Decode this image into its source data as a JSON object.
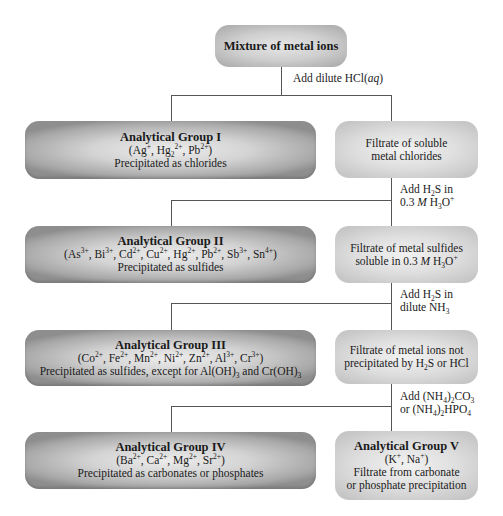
{
  "diagram": {
    "start": {
      "title": "Mixture of metal ions"
    },
    "steps": [
      {
        "reagent_line1": "Add dilute HCl(aq)",
        "reagent_line2": ""
      },
      {
        "reagent_line1": "Add H2S in",
        "reagent_line2": "0.3 M H3O+"
      },
      {
        "reagent_line1": "Add H2S in",
        "reagent_line2": "dilute NH3"
      },
      {
        "reagent_line1": "Add (NH4)2CO3",
        "reagent_line2": "or (NH4)2HPO4"
      }
    ],
    "groups": [
      {
        "title": "Analytical Group I",
        "ions": "(Ag+, Hg2 2+, Pb2+)",
        "note": "Precipitated as chlorides"
      },
      {
        "title": "Analytical Group II",
        "ions": "(As3+, Bi3+, Cd2+, Cu2+, Hg2+, Pb2+, Sb3+, Sn4+)",
        "note": "Precipitated as sulfides"
      },
      {
        "title": "Analytical Group III",
        "ions": "(Co2+, Fe2+, Mn2+, Ni2+, Zn2+, Al3+, Cr3+)",
        "note": "Precipitated as sulfides, except for Al(OH)3 and Cr(OH)3"
      },
      {
        "title": "Analytical Group IV",
        "ions": "(Ba2+, Ca2+, Mg2+, Sr2+)",
        "note": "Precipitated as carbonates or phosphates"
      }
    ],
    "filtrates": [
      {
        "line1": "Filtrate of soluble",
        "line2": "metal chlorides"
      },
      {
        "line1": "Filtrate of metal sulfides",
        "line2": "soluble in 0.3 M H3O+"
      },
      {
        "line1": "Filtrate of metal ions not",
        "line2": "precipitated by H2S or HCl"
      }
    ],
    "final": {
      "title": "Analytical Group V",
      "ions": "(K+, Na+)",
      "note_line1": "Filtrate from carbonate",
      "note_line2": "or phosphate precipitation"
    }
  }
}
